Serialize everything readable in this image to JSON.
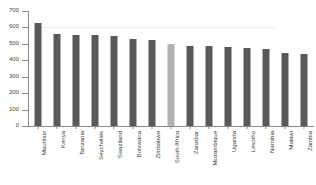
{
  "chart_data": {
    "type": "bar",
    "title": "",
    "xlabel": "",
    "ylabel": "",
    "ylim": [
      0,
      700
    ],
    "ytick_step": 100,
    "yticks": [
      700,
      600,
      500,
      400,
      300,
      200,
      100,
      0
    ],
    "ytick_labels": [
      "700",
      "600",
      "500",
      "400",
      "300",
      "200",
      "100",
      "0"
    ],
    "grid": false,
    "legend": null,
    "categories": [
      "Mauritius",
      "Kenya",
      "Tanzania",
      "Seychelles",
      "Swaziland",
      "Botswana",
      "Zimbabwe",
      "South Africa",
      "Zanzibar",
      "Mozambique",
      "Uganda",
      "Lesotho",
      "Namibia",
      "Malawi",
      "Zambia"
    ],
    "values": [
      625,
      560,
      555,
      555,
      548,
      528,
      525,
      498,
      490,
      487,
      478,
      477,
      468,
      447,
      440
    ],
    "highlight_index": 7,
    "bar_color": "#595959",
    "highlight_color": "#b2b2b2",
    "axis_color": "#8a8a8a"
  }
}
